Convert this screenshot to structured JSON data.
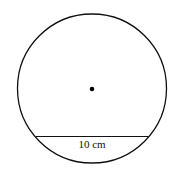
{
  "diagram": {
    "type": "circle-with-chord",
    "circle": {
      "cx": 92,
      "cy": 88.5,
      "r": 74.5,
      "stroke": "#111111"
    },
    "center_point": {
      "cx": 92,
      "cy": 89,
      "r": 2.3
    },
    "chord": {
      "x1": 36,
      "y1": 136.5,
      "x2": 148.5,
      "y2": 136.5
    },
    "chord_label": "10 cm"
  }
}
